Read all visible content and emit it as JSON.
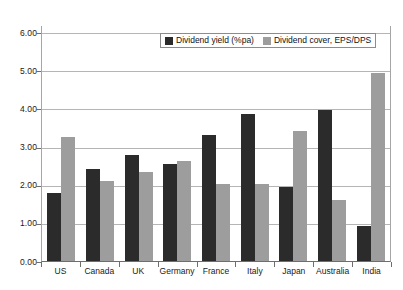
{
  "chart_data": {
    "type": "bar",
    "title": "",
    "subtitle": "",
    "xlabel": "",
    "ylabel": "",
    "ylim": [
      0,
      6
    ],
    "ytick_step": 1,
    "ytick_labels": [
      "6.00",
      "5.00",
      "4.00",
      "3.00",
      "2.00",
      "1.00",
      "0.00"
    ],
    "ytick_values": [
      6,
      5,
      4,
      3,
      2,
      1,
      0
    ],
    "grid": "horizontal",
    "legend_position": "top-center",
    "categories": [
      "US",
      "Canada",
      "UK",
      "Germany",
      "France",
      "Italy",
      "Japan",
      "Australia",
      "India"
    ],
    "series": [
      {
        "name": "Dividend yield (%pa)",
        "color": "#2b2b2b",
        "values": [
          1.78,
          2.41,
          2.77,
          2.55,
          3.29,
          3.84,
          1.95,
          3.96,
          0.92
        ]
      },
      {
        "name": "Dividend cover, EPS/DPS",
        "color": "#9d9d9d",
        "values": [
          3.25,
          2.09,
          2.32,
          2.63,
          2.03,
          2.02,
          3.4,
          1.61,
          4.93
        ]
      }
    ]
  },
  "colors": {
    "series_0": "#2b2b2b",
    "series_1": "#9d9d9d",
    "gridline": "#b5b5b5",
    "axis": "#6e6e6e",
    "text": "#1a1a1a",
    "background": "#ffffff"
  }
}
